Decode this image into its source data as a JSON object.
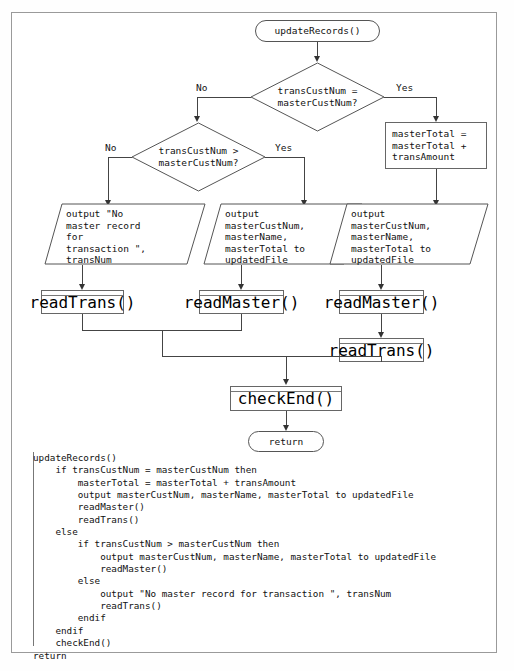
{
  "diagram": {
    "start": {
      "label": "updateRecords()"
    },
    "decisions": [
      {
        "id": "d1",
        "line1": "transCustNum =",
        "line2": "masterCustNum?",
        "no_label": "No",
        "yes_label": "Yes"
      },
      {
        "id": "d2",
        "line1": "transCustNum >",
        "line2": "masterCustNum?",
        "no_label": "No",
        "yes_label": "Yes"
      }
    ],
    "process_assign": {
      "text": "masterTotal =\nmasterTotal +\ntransAmount"
    },
    "io_nodes": [
      {
        "id": "io-left",
        "text": "output \"No\nmaster record\nfor\ntransaction \",\ntransNum"
      },
      {
        "id": "io-mid",
        "text": "output\nmasterCustNum,\nmasterName,\nmasterTotal to\nupdatedFile"
      },
      {
        "id": "io-right",
        "text": "output\nmasterCustNum,\nmasterName,\nmasterTotal to\nupdatedFile"
      }
    ],
    "modules": [
      {
        "id": "m-readtrans-left",
        "label": "readTrans()"
      },
      {
        "id": "m-readmaster-mid",
        "label": "readMaster()"
      },
      {
        "id": "m-readmaster-right",
        "label": "readMaster()"
      },
      {
        "id": "m-readtrans-right",
        "label": "readTrans()"
      },
      {
        "id": "m-checkend",
        "label": "checkEnd()"
      }
    ],
    "end": {
      "label": "return"
    }
  },
  "pseudocode": {
    "lines": "updateRecords()\n    if transCustNum = masterCustNum then\n        masterTotal = masterTotal + transAmount\n        output masterCustNum, masterName, masterTotal to updatedFile\n        readMaster()\n        readTrans()\n    else\n        if transCustNum > masterCustNum then\n            output masterCustNum, masterName, masterTotal to updatedFile\n            readMaster()\n        else\n            output \"No master record for transaction \", transNum\n            readTrans()\n        endif\n    endif\n    checkEnd()\nreturn"
  },
  "colors": {
    "border": "#9a9a9a",
    "shape_stroke": "#555555",
    "connector": "#444444",
    "text": "#111111",
    "background": "#ffffff"
  }
}
